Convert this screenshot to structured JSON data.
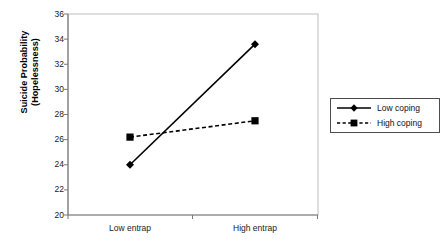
{
  "chart_data": {
    "type": "line",
    "title": "",
    "subtitle": "",
    "xlabel": "",
    "ylabel": "Suicide Probability (Hopelessness)",
    "ylabel_lines": [
      "Suicide Probability",
      "(Hopelessness)"
    ],
    "categories": [
      "Low entrap",
      "High entrap"
    ],
    "series": [
      {
        "name": "Low coping",
        "values": [
          24.0,
          33.6
        ],
        "linestyle": "solid",
        "marker": "diamond",
        "color": "#000000"
      },
      {
        "name": "High coping",
        "values": [
          26.2,
          27.5
        ],
        "linestyle": "dashed",
        "marker": "square",
        "color": "#000000"
      }
    ],
    "ylim": [
      20,
      36
    ],
    "yticks": [
      20,
      22,
      24,
      26,
      28,
      30,
      32,
      34,
      36
    ],
    "ytick_labels": [
      "20",
      "22",
      "24",
      "26",
      "28",
      "30",
      "32",
      "34",
      "36"
    ],
    "grid": false,
    "legend_position": "right",
    "legend_entries": [
      "Low coping",
      "High coping"
    ],
    "axis_color": "#808080",
    "plot_background": "#ffffff"
  }
}
